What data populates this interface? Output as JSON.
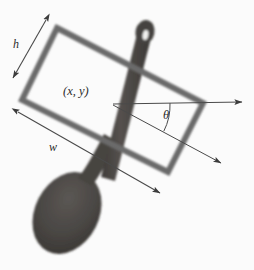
{
  "figure": {
    "background_color": "#ffffff",
    "width": 254,
    "height": 270
  },
  "labels": {
    "height_label": "h",
    "width_label": "w",
    "center_label": "(x, y)",
    "angle_label": "θ"
  },
  "colors": {
    "box_stroke": "#6a6a6a",
    "object_fill": "#4a4744",
    "object_edge": "#3a3734",
    "annotation_line": "#4a4a4a",
    "label_text": "#2b2b2b",
    "background": "#ffffff"
  },
  "geometry": {
    "box_corners": {
      "top_left": [
        57,
        28
      ],
      "top_right": [
        203,
        103
      ],
      "bottom_right": [
        168,
        172
      ],
      "bottom_left": [
        22,
        100
      ]
    },
    "center": [
      113,
      105
    ],
    "rotation_angle_deg": 27,
    "height_arrow": {
      "from": [
        46,
        20
      ],
      "to": [
        13,
        78
      ]
    },
    "width_arrow": {
      "from": [
        18,
        112
      ],
      "to": [
        160,
        193
      ]
    },
    "reference_axis_arrow": {
      "from": [
        113,
        105
      ],
      "to": [
        243,
        103
      ]
    },
    "rotated_axis_arrow": {
      "from": [
        113,
        105
      ],
      "to": [
        222,
        164
      ]
    },
    "angle_arc_radius": 57
  },
  "object": {
    "name": "wooden-spoon",
    "handle": {
      "tip": [
        146,
        26
      ],
      "base": [
        84,
        174
      ]
    },
    "bowl": {
      "center": [
        67,
        213
      ],
      "rx": 32,
      "ry": 43,
      "tilt_deg": 27
    },
    "hole": {
      "center": [
        145,
        36
      ],
      "rx": 3,
      "ry": 5
    }
  }
}
